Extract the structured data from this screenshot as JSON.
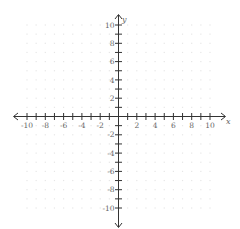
{
  "chart_data": {
    "type": "scatter",
    "title": "",
    "xlabel": "x",
    "ylabel": "y",
    "xlim": [
      -10,
      10
    ],
    "ylim": [
      -10,
      10
    ],
    "grid": "dots",
    "x_tick_step": 1,
    "y_tick_step": 1,
    "x_tick_labels": [
      "-10",
      "-8",
      "-6",
      "-4",
      "-2",
      "2",
      "4",
      "6",
      "8",
      "10"
    ],
    "y_tick_labels": [
      "10",
      "8",
      "6",
      "4",
      "2",
      "-2",
      "-4",
      "-6",
      "-8",
      "-10"
    ],
    "series": [],
    "arrows": "both-ends"
  },
  "colors": {
    "axis": "#333333",
    "grid_dot": "#e6e6e6",
    "label": "#666666"
  }
}
